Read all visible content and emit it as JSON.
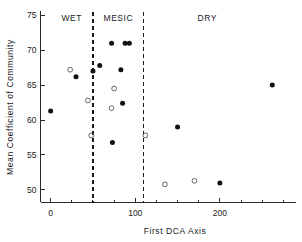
{
  "chart_data": {
    "type": "scatter",
    "title": "",
    "xlabel": "First DCA Axis",
    "ylabel": "Mean Coefficient of Community",
    "xlim": [
      -12,
      290
    ],
    "ylim": [
      48.2,
      75.6
    ],
    "xticks": [
      0,
      100,
      200
    ],
    "xticklabels": [
      "0",
      "100",
      "200"
    ],
    "xminorticks": [
      25,
      50,
      75,
      125,
      150,
      175,
      225,
      250,
      275
    ],
    "yticks": [
      50,
      55,
      60,
      65,
      70,
      75
    ],
    "yticklabels": [
      "50",
      "55",
      "60",
      "65",
      "70",
      "75"
    ],
    "grid": false,
    "legend": null,
    "annotations": [
      {
        "text": "WET",
        "x": 25,
        "y": 74.2
      },
      {
        "text": "MESIC",
        "x": 80,
        "y": 74.2
      },
      {
        "text": "DRY",
        "x": 185,
        "y": 74.2
      }
    ],
    "vlines": [
      {
        "x": 50,
        "style": "dashed",
        "label": "wet-mesic boundary"
      },
      {
        "x": 110,
        "style": "dashed",
        "label": "mesic-dry boundary"
      }
    ],
    "series": [
      {
        "name": "filled",
        "marker": "filled-circle",
        "color": "#111111",
        "points": [
          {
            "x": 0,
            "y": 61.3
          },
          {
            "x": 30,
            "y": 66.2
          },
          {
            "x": 50,
            "y": 67.0
          },
          {
            "x": 58,
            "y": 67.8
          },
          {
            "x": 72,
            "y": 71.0
          },
          {
            "x": 88,
            "y": 71.0
          },
          {
            "x": 93,
            "y": 71.0
          },
          {
            "x": 83,
            "y": 67.2
          },
          {
            "x": 85,
            "y": 62.4
          },
          {
            "x": 73,
            "y": 56.8
          },
          {
            "x": 150,
            "y": 59.0
          },
          {
            "x": 200,
            "y": 51.0
          },
          {
            "x": 262,
            "y": 65.0
          }
        ]
      },
      {
        "name": "open",
        "marker": "open-circle",
        "color": "#555555",
        "points": [
          {
            "x": 23,
            "y": 67.2
          },
          {
            "x": 44,
            "y": 62.8
          },
          {
            "x": 48,
            "y": 57.8
          },
          {
            "x": 75,
            "y": 64.5
          },
          {
            "x": 72,
            "y": 61.7
          },
          {
            "x": 112,
            "y": 57.8
          },
          {
            "x": 135,
            "y": 50.8
          },
          {
            "x": 170,
            "y": 51.3
          }
        ]
      }
    ]
  }
}
